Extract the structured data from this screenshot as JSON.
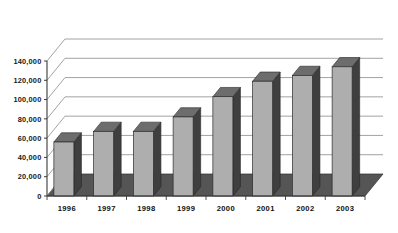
{
  "chart_data": {
    "type": "bar",
    "title": "",
    "subtitle": "",
    "xlabel": "",
    "ylabel": "",
    "categories": [
      "1996",
      "1997",
      "1998",
      "1999",
      "2000",
      "2001",
      "2002",
      "2003"
    ],
    "values": [
      56000,
      67000,
      67000,
      82000,
      103000,
      119000,
      125000,
      134000
    ],
    "series": [
      {
        "name": "",
        "values": [
          56000,
          67000,
          67000,
          82000,
          103000,
          119000,
          125000,
          134000
        ]
      }
    ],
    "ylim": [
      0,
      140000
    ],
    "yticks": [
      0,
      20000,
      40000,
      60000,
      80000,
      100000,
      120000,
      140000
    ],
    "ytick_labels": [
      "0",
      "20,000",
      "40,000",
      "60,000",
      "80,000",
      "100,000",
      "120,000",
      "140,000"
    ],
    "grid": true,
    "legend": false,
    "legend_position": "none",
    "style": "3d-column",
    "annotations": []
  },
  "colors": {
    "bar_front": "#aeaeae",
    "bar_side": "#3f3f3f",
    "bar_top": "#6d6d6d",
    "floor": "#555555",
    "gridline": "#8a8a8a",
    "axis": "#3a3a3a",
    "background": "#ffffff",
    "text": "#141414"
  }
}
